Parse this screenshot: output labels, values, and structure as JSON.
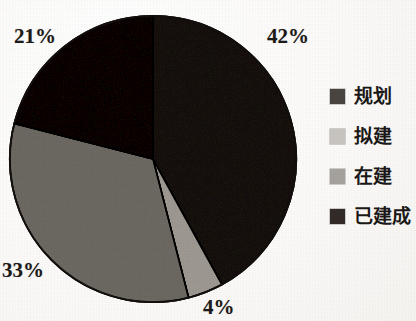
{
  "chart_data": {
    "type": "pie",
    "title": "",
    "subtitle": "",
    "xlabel": "",
    "ylabel": "",
    "legend_position": "right",
    "grid": false,
    "start_angle_deg": 0,
    "direction": "clockwise",
    "categories": [
      "规划",
      "拟建",
      "在建",
      "已建成"
    ],
    "values": [
      42,
      4,
      33,
      21
    ],
    "value_unit": "%",
    "data_labels": [
      "42%",
      "4%",
      "33%",
      "21%"
    ],
    "colors": [
      "#4b4541",
      "#c9c6c1",
      "#a6a39e",
      "#332b27"
    ],
    "slices": [
      {
        "label": "规划",
        "value": 42,
        "data_label": "42%",
        "color": "#4b4541"
      },
      {
        "label": "拟建",
        "value": 4,
        "data_label": "4%",
        "color": "#c9c6c1"
      },
      {
        "label": "在建",
        "value": 33,
        "data_label": "33%",
        "color": "#a6a39e"
      },
      {
        "label": "已建成",
        "value": 21,
        "data_label": "21%",
        "color": "#332b27"
      }
    ]
  },
  "labels": {
    "pct_planning": "42%",
    "pct_proposed": "4%",
    "pct_building": "33%",
    "pct_completed": "21%"
  },
  "legend": {
    "items": [
      {
        "label": "规划",
        "color": "#4b4541"
      },
      {
        "label": "拟建",
        "color": "#c9c6c1"
      },
      {
        "label": "在建",
        "color": "#a6a39e"
      },
      {
        "label": "已建成",
        "color": "#332b27"
      }
    ]
  }
}
